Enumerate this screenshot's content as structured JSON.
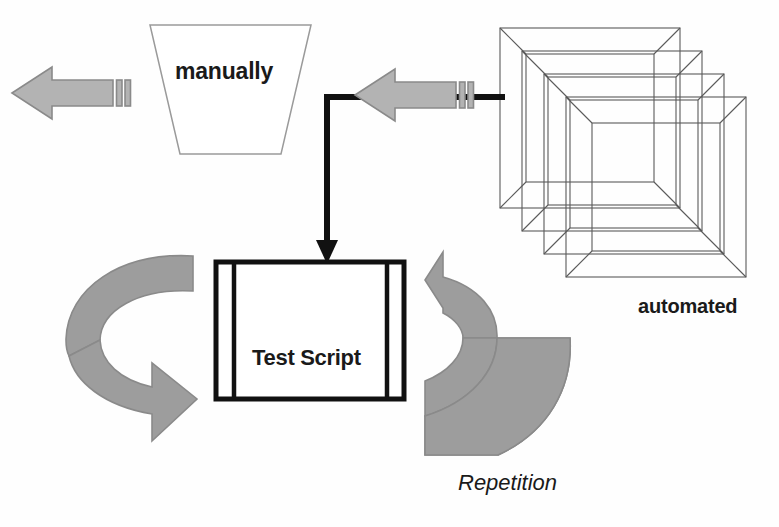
{
  "diagram": {
    "background_color": "#fefefe",
    "labels": {
      "manually": "manually",
      "test_script": "Test Script",
      "automated": "automated",
      "repetition": "Repetition"
    },
    "colors": {
      "arrow_fill": "#b3b3b3",
      "arrow_stroke": "#8c8c8c",
      "curved_arrow_fill": "#9d9d9d",
      "curved_arrow_stroke": "#8a8a8a",
      "frame_stroke": "#5a5a5a",
      "connector_stroke": "#111111",
      "box_stroke": "#111111",
      "trapezoid_stroke": "#9a9a9a",
      "text_color": "#1a1a1a"
    },
    "shapes": {
      "left_striped_arrow": {
        "name": "striped-left-arrow",
        "direction": "left",
        "stripes": 2
      },
      "center_striped_arrow": {
        "name": "striped-left-arrow",
        "direction": "left",
        "stripes": 2
      },
      "trapezoid": {
        "name": "manual-funnel-trapezoid",
        "orientation": "wide-top"
      },
      "frame_stack": {
        "name": "stacked-frames",
        "count": 4
      },
      "test_script_box": {
        "name": "predefined-process-box",
        "inner_lines": 2
      },
      "left_circular_arrow": {
        "name": "circular-arrow-left",
        "direction": "clockwise-lower-right"
      },
      "right_circular_arrow": {
        "name": "circular-arrow-right",
        "direction": "clockwise-upper-left"
      },
      "elbow_connector": {
        "name": "elbow-connector-arrow",
        "path": "right-to-left then down"
      }
    }
  }
}
